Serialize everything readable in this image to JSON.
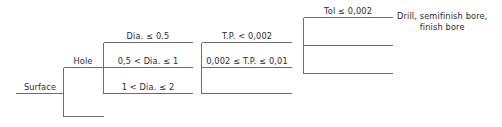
{
  "diagram": {
    "type": "decision-tree",
    "title": "",
    "orientation": "left-to-right",
    "line_color": "#6d6d6d",
    "text_color": "#2b2b2b",
    "root": {
      "label": "Surface",
      "children": [
        {
          "label": "Hole",
          "children": [
            {
              "label": "Dia. ≤ 0.5",
              "children": [
                {
                  "label": "T.P. < 0,002",
                  "children": [
                    {
                      "label": "Tol ≤ 0,002",
                      "children": [
                        {
                          "label": "Drill, semifinish bore, finish bore"
                        }
                      ]
                    }
                  ]
                }
              ]
            },
            {
              "label": "0,5 < Dia. ≤ 1"
            },
            {
              "label": "1 < Dia. ≤ 2"
            }
          ]
        }
      ]
    },
    "nodes": {
      "root": "Surface",
      "level1": "Hole",
      "level2": [
        "Dia. ≤ 0.5",
        "0,5 < Dia. ≤ 1",
        "1 < Dia. ≤ 2"
      ],
      "level3": [
        "T.P. < 0,002",
        "0,002 ≤ T.P. ≤ 0,01"
      ],
      "level4": [
        "Tol ≤ 0,002"
      ],
      "leaf": {
        "line1": "Drill, semifinish bore,",
        "line2": "finish bore"
      }
    }
  }
}
